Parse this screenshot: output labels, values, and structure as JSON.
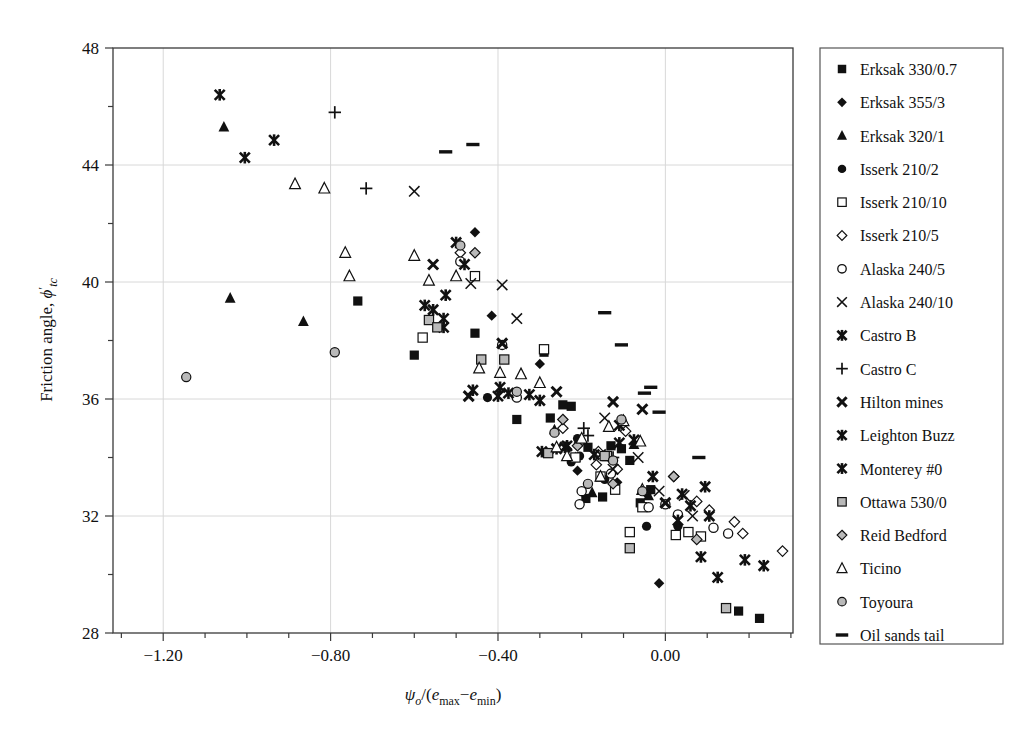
{
  "chart_data": {
    "type": "scatter",
    "title": "",
    "xlabel": "ψo/(emax−emin)",
    "ylabel": "Friction angle, ϕ'tc",
    "xlim": [
      -1.32,
      0.305
    ],
    "ylim": [
      28,
      48
    ],
    "xticks": [
      -1.2,
      -0.8,
      -0.4,
      0.0
    ],
    "xtick_labels": [
      "−1.20",
      "−0.80",
      "−0.40",
      "0.00"
    ],
    "yticks": [
      28,
      32,
      36,
      40,
      44,
      48
    ],
    "ytick_labels": [
      "28",
      "32",
      "36",
      "40",
      "44",
      "48"
    ],
    "xminor_step": 0.1,
    "yminor_step": 2,
    "grid": true,
    "grid_color": "#d8d8d8",
    "frame_color": "#3a3a3a",
    "legend_position": "right-outside",
    "legend_border_color": "#555555",
    "series": [
      {
        "name": "Erksak 330/0.7",
        "marker": "filled-square",
        "points": [
          [
            -0.735,
            39.35
          ],
          [
            -0.6,
            37.5
          ],
          [
            -0.455,
            38.25
          ],
          [
            -0.355,
            35.3
          ],
          [
            -0.29,
            37.6
          ],
          [
            -0.275,
            35.35
          ],
          [
            -0.225,
            35.75
          ],
          [
            -0.245,
            35.8
          ],
          [
            -0.185,
            34.35
          ],
          [
            -0.19,
            32.6
          ],
          [
            -0.15,
            32.65
          ],
          [
            -0.105,
            34.3
          ],
          [
            -0.13,
            34.4
          ],
          [
            -0.085,
            33.9
          ],
          [
            -0.06,
            32.45
          ],
          [
            -0.035,
            32.9
          ],
          [
            0.175,
            28.75
          ],
          [
            0.225,
            28.5
          ]
        ]
      },
      {
        "name": "Erksak 355/3",
        "marker": "filled-diamond",
        "points": [
          [
            -0.455,
            41.7
          ],
          [
            -0.415,
            38.85
          ],
          [
            -0.3,
            37.2
          ],
          [
            -0.235,
            34.3
          ],
          [
            -0.21,
            33.55
          ],
          [
            -0.135,
            34.0
          ],
          [
            -0.115,
            33.15
          ],
          [
            -0.045,
            32.75
          ],
          [
            -0.015,
            29.7
          ]
        ]
      },
      {
        "name": "Erksak 320/1",
        "marker": "filled-triangle",
        "points": [
          [
            -1.055,
            45.3
          ],
          [
            -1.04,
            39.45
          ],
          [
            -0.865,
            38.65
          ],
          [
            -0.265,
            34.95
          ],
          [
            -0.215,
            34.0
          ],
          [
            -0.175,
            32.8
          ],
          [
            -0.075,
            34.45
          ],
          [
            -0.04,
            32.7
          ]
        ]
      },
      {
        "name": "Isserk 210/2",
        "marker": "filled-circle",
        "points": [
          [
            -0.425,
            36.05
          ],
          [
            -0.225,
            33.85
          ],
          [
            -0.21,
            34.65
          ],
          [
            -0.205,
            34.05
          ],
          [
            -0.145,
            33.25
          ],
          [
            -0.045,
            31.65
          ],
          [
            0.03,
            31.65
          ]
        ]
      },
      {
        "name": "Isserk 210/10",
        "marker": "open-square",
        "points": [
          [
            -0.58,
            38.1
          ],
          [
            -0.455,
            40.2
          ],
          [
            -0.29,
            37.7
          ],
          [
            -0.215,
            34.0
          ],
          [
            -0.14,
            34.05
          ],
          [
            -0.155,
            33.35
          ],
          [
            -0.12,
            32.9
          ],
          [
            -0.085,
            31.45
          ],
          [
            -0.055,
            32.3
          ],
          [
            0.025,
            31.35
          ],
          [
            0.055,
            31.45
          ],
          [
            0.085,
            31.3
          ]
        ]
      },
      {
        "name": "Isserk 210/5",
        "marker": "open-diamond",
        "points": [
          [
            -0.49,
            41.0
          ],
          [
            -0.245,
            35.0
          ],
          [
            -0.205,
            34.5
          ],
          [
            -0.16,
            34.2
          ],
          [
            -0.165,
            33.75
          ],
          [
            -0.095,
            34.9
          ],
          [
            -0.115,
            33.6
          ],
          [
            0.02,
            33.35
          ],
          [
            0.075,
            32.5
          ],
          [
            0.105,
            32.2
          ],
          [
            0.165,
            31.8
          ],
          [
            0.185,
            31.4
          ],
          [
            0.28,
            30.8
          ]
        ]
      },
      {
        "name": "Alaska 240/5",
        "marker": "open-circle",
        "points": [
          [
            -0.49,
            40.7
          ],
          [
            -0.39,
            37.85
          ],
          [
            -0.355,
            36.05
          ],
          [
            -0.2,
            32.85
          ],
          [
            -0.205,
            32.4
          ],
          [
            -0.13,
            33.45
          ],
          [
            -0.04,
            32.3
          ],
          [
            0.0,
            32.4
          ],
          [
            0.03,
            32.05
          ],
          [
            0.115,
            31.6
          ],
          [
            0.15,
            31.4
          ]
        ]
      },
      {
        "name": "Alaska 240/10",
        "marker": "cross-x",
        "points": [
          [
            -0.6,
            43.1
          ],
          [
            -0.465,
            39.95
          ],
          [
            -0.39,
            39.9
          ],
          [
            -0.355,
            38.75
          ],
          [
            -0.145,
            35.35
          ],
          [
            -0.155,
            34.1
          ],
          [
            -0.125,
            33.6
          ],
          [
            -0.065,
            34.0
          ],
          [
            -0.015,
            32.85
          ],
          [
            0.045,
            32.7
          ],
          [
            0.065,
            32.0
          ]
        ]
      },
      {
        "name": "Castro B",
        "marker": "star-x",
        "points": [
          [
            -1.065,
            46.4
          ],
          [
            -1.005,
            44.25
          ],
          [
            -0.935,
            44.85
          ],
          [
            -0.5,
            41.35
          ],
          [
            -0.48,
            40.6
          ],
          [
            -0.575,
            39.2
          ],
          [
            -0.53,
            38.75
          ],
          [
            -0.53,
            38.45
          ],
          [
            -0.395,
            36.4
          ],
          [
            -0.46,
            36.3
          ],
          [
            -0.375,
            36.2
          ],
          [
            -0.26,
            34.3
          ],
          [
            -0.11,
            35.1
          ],
          [
            -0.11,
            34.5
          ],
          [
            -0.075,
            34.6
          ],
          [
            -0.03,
            33.35
          ],
          [
            0.04,
            32.75
          ],
          [
            0.06,
            32.35
          ],
          [
            0.03,
            31.85
          ],
          [
            0.095,
            33.0
          ],
          [
            0.105,
            32.0
          ],
          [
            0.085,
            30.6
          ],
          [
            0.125,
            29.9
          ],
          [
            0.19,
            30.5
          ],
          [
            0.235,
            30.3
          ]
        ]
      },
      {
        "name": "Castro C",
        "marker": "plus",
        "points": [
          [
            -0.79,
            45.8
          ],
          [
            -0.715,
            43.2
          ],
          [
            -0.195,
            35.0
          ],
          [
            -0.185,
            34.75
          ],
          [
            -0.125,
            34.0
          ]
        ]
      },
      {
        "name": "Hilton mines",
        "marker": "heavy-x",
        "points": [
          [
            -0.555,
            40.6
          ],
          [
            -0.47,
            36.1
          ],
          [
            -0.39,
            37.9
          ],
          [
            -0.26,
            36.25
          ],
          [
            -0.125,
            35.9
          ],
          [
            -0.055,
            35.65
          ],
          [
            0.0,
            32.45
          ]
        ]
      },
      {
        "name": "Leighton Buzz",
        "marker": "star-x",
        "points": [
          [
            -0.555,
            39.05
          ],
          [
            -0.4,
            36.1
          ],
          [
            -0.295,
            34.2
          ],
          [
            -0.24,
            34.35
          ],
          [
            -0.17,
            34.1
          ]
        ]
      },
      {
        "name": "Monterey #0",
        "marker": "star-x",
        "points": [
          [
            -0.525,
            39.55
          ],
          [
            -0.325,
            36.15
          ],
          [
            -0.3,
            35.95
          ],
          [
            -0.235,
            34.4
          ]
        ]
      },
      {
        "name": "Ottawa 530/0",
        "marker": "grey-square",
        "points": [
          [
            -0.565,
            38.7
          ],
          [
            -0.545,
            38.45
          ],
          [
            -0.44,
            37.35
          ],
          [
            -0.385,
            37.35
          ],
          [
            -0.28,
            34.15
          ],
          [
            -0.145,
            34.05
          ],
          [
            -0.085,
            30.9
          ],
          [
            0.145,
            28.85
          ]
        ]
      },
      {
        "name": "Reid Bedford",
        "marker": "grey-diamond",
        "points": [
          [
            -0.455,
            41.0
          ],
          [
            -0.245,
            35.3
          ],
          [
            -0.21,
            34.4
          ],
          [
            -0.125,
            33.1
          ],
          [
            0.02,
            33.35
          ],
          [
            0.075,
            31.2
          ]
        ]
      },
      {
        "name": "Ticino",
        "marker": "open-triangle",
        "points": [
          [
            -0.885,
            43.35
          ],
          [
            -0.815,
            43.2
          ],
          [
            -0.765,
            41.0
          ],
          [
            -0.755,
            40.2
          ],
          [
            -0.6,
            40.9
          ],
          [
            -0.565,
            40.05
          ],
          [
            -0.5,
            40.2
          ],
          [
            -0.445,
            37.05
          ],
          [
            -0.395,
            36.9
          ],
          [
            -0.345,
            36.85
          ],
          [
            -0.3,
            36.55
          ],
          [
            -0.26,
            34.35
          ],
          [
            -0.235,
            34.05
          ],
          [
            -0.2,
            34.65
          ],
          [
            -0.155,
            33.35
          ],
          [
            -0.135,
            35.05
          ],
          [
            -0.1,
            35.25
          ],
          [
            -0.06,
            34.55
          ],
          [
            -0.055,
            32.9
          ]
        ]
      },
      {
        "name": "Toyoura",
        "marker": "grey-circle",
        "points": [
          [
            -1.145,
            36.75
          ],
          [
            -0.79,
            37.6
          ],
          [
            -0.49,
            41.25
          ],
          [
            -0.355,
            36.25
          ],
          [
            -0.265,
            34.85
          ],
          [
            -0.185,
            33.1
          ],
          [
            -0.125,
            33.9
          ],
          [
            -0.105,
            35.3
          ],
          [
            -0.055,
            32.85
          ]
        ]
      },
      {
        "name": "Oil sands tail",
        "marker": "dash",
        "points": [
          [
            -0.525,
            44.45
          ],
          [
            -0.46,
            44.7
          ],
          [
            -0.145,
            38.95
          ],
          [
            -0.105,
            37.85
          ],
          [
            -0.05,
            36.2
          ],
          [
            -0.035,
            36.4
          ],
          [
            -0.015,
            35.55
          ],
          [
            0.08,
            34.0
          ]
        ]
      }
    ]
  },
  "legend": {
    "items": [
      {
        "label": "Erksak 330/0.7",
        "marker": "filled-square"
      },
      {
        "label": "Erksak 355/3",
        "marker": "filled-diamond"
      },
      {
        "label": "Erksak 320/1",
        "marker": "filled-triangle"
      },
      {
        "label": "Isserk 210/2",
        "marker": "filled-circle"
      },
      {
        "label": "Isserk 210/10",
        "marker": "open-square"
      },
      {
        "label": "Isserk 210/5",
        "marker": "open-diamond"
      },
      {
        "label": "Alaska 240/5",
        "marker": "open-circle"
      },
      {
        "label": "Alaska 240/10",
        "marker": "cross-x"
      },
      {
        "label": "Castro B",
        "marker": "star-x"
      },
      {
        "label": "Castro C",
        "marker": "plus"
      },
      {
        "label": "Hilton mines",
        "marker": "heavy-x"
      },
      {
        "label": "Leighton Buzz",
        "marker": "star-x"
      },
      {
        "label": "Monterey #0",
        "marker": "star-x"
      },
      {
        "label": "Ottawa 530/0",
        "marker": "grey-square"
      },
      {
        "label": "Reid Bedford",
        "marker": "grey-diamond"
      },
      {
        "label": "Ticino",
        "marker": "open-triangle"
      },
      {
        "label": "Toyoura",
        "marker": "grey-circle"
      },
      {
        "label": "Oil sands tail",
        "marker": "dash"
      }
    ]
  },
  "axis_label_parts": {
    "y_prefix": "Friction angle, ",
    "y_symbol": "ϕ",
    "y_prime": "′",
    "y_sub": "tc",
    "x_psi": "ψ",
    "x_psi_sub": "o",
    "x_slash": "/(",
    "x_e1": "e",
    "x_e1_sub": "max",
    "x_minus": "−",
    "x_e2": "e",
    "x_e2_sub": "min",
    "x_close": ")"
  }
}
